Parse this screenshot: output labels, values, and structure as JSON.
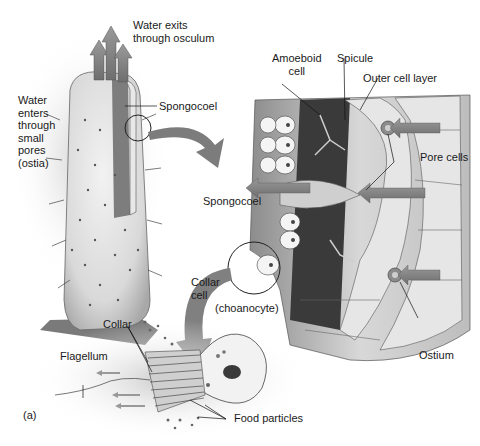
{
  "figure": {
    "panel_label": "(a)",
    "labels": {
      "water_exits": "Water exits\nthrough osculum",
      "water_enters": "Water\nenters\nthrough\nsmall\npores\n(ostia)",
      "spongocoel_top": "Spongocoel",
      "amoeboid_cell": "Amoeboid\ncell",
      "spicule": "Spicule",
      "outer_cell_layer": "Outer cell layer",
      "pore_cells": "Pore cells",
      "spongocoel_mid": "Spongocoel",
      "collar_cell": "Collar\ncell",
      "choanocyte": "(choanocyte)",
      "ostium": "Ostium",
      "collar": "Collar",
      "flagellum": "Flagellum",
      "food_particles": "Food particles"
    }
  }
}
